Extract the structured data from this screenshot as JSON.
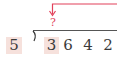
{
  "diagram": {
    "type": "long-division",
    "divisor": "5",
    "dividend_digits": [
      "3",
      "6",
      "4",
      "2"
    ],
    "highlighted_digit_index": 0,
    "question_mark": "?",
    "colors": {
      "arrow": "#e2415a",
      "highlight_bg": "#f6e1dc",
      "text": "#3a3a3a",
      "division_bar": "#555555"
    }
  }
}
